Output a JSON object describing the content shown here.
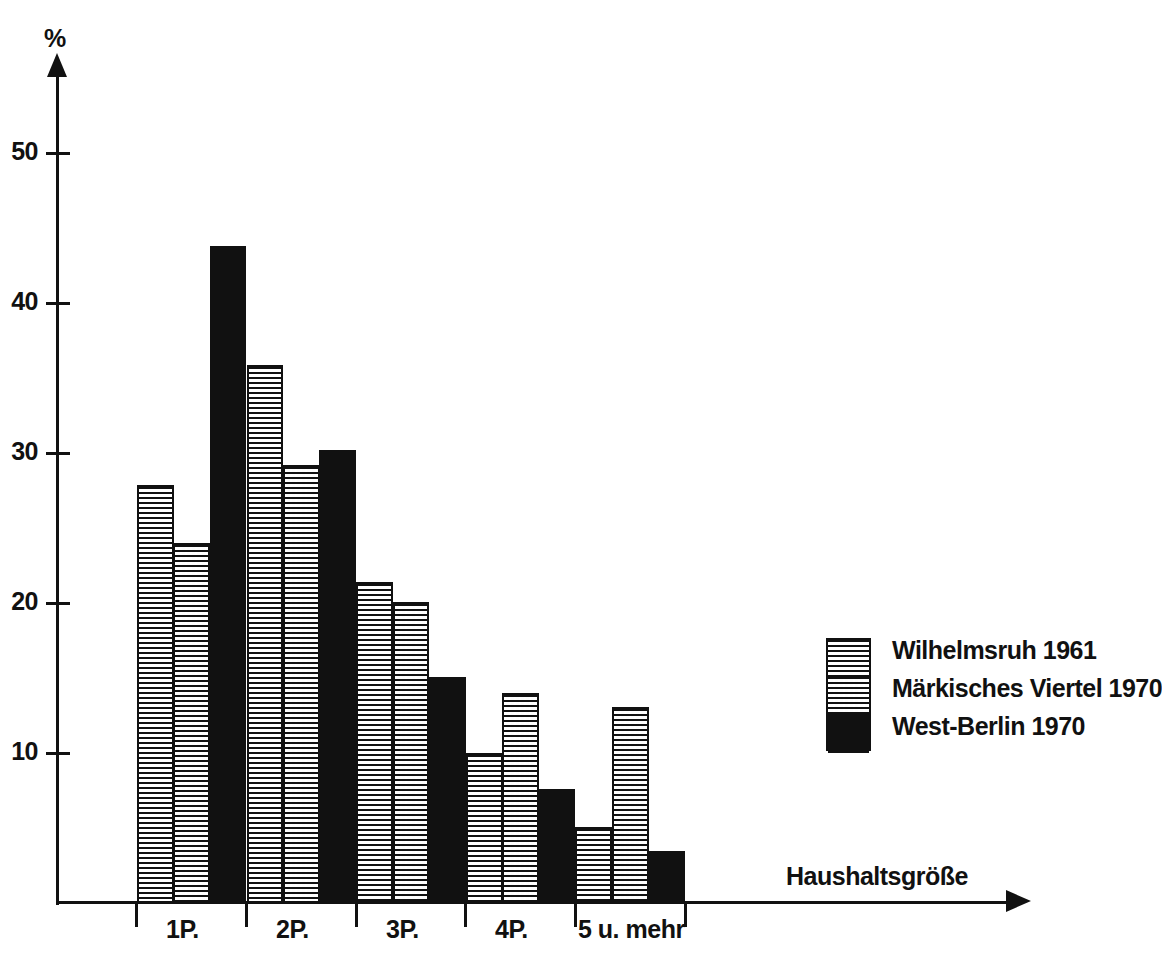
{
  "chart_data": {
    "type": "bar",
    "title": "",
    "subtitle": "",
    "xlabel": "Haushaltsgröße",
    "ylabel": "%",
    "categories": [
      "1 P.",
      "2 P.",
      "3 P.",
      "4 P.",
      "5 u. mehr"
    ],
    "category_labels": [
      "1P.",
      "2P.",
      "3P.",
      "4P.",
      "5 u. mehr"
    ],
    "series": [
      {
        "name": "Wilhelmsruh 1961",
        "pattern": "horizontal-lines",
        "color": "#111111",
        "values": [
          27.9,
          35.9,
          21.4,
          10.0,
          5.1
        ]
      },
      {
        "name": "Märkisches Viertel 1970",
        "pattern": "dot-grid",
        "color": "#111111",
        "values": [
          24.0,
          29.2,
          20.1,
          14.0,
          13.1
        ]
      },
      {
        "name": "West-Berlin 1970",
        "pattern": "solid-black",
        "color": "#111111",
        "values": [
          43.8,
          30.2,
          15.1,
          7.6,
          3.5
        ]
      }
    ],
    "ylim": [
      0,
      56
    ],
    "yticks": [
      10,
      20,
      30,
      40,
      50
    ],
    "ytick_labels": [
      "10",
      "20",
      "30",
      "40",
      "50"
    ],
    "grid": false,
    "legend_position": "right"
  },
  "axes": {
    "y_unit_label": "%",
    "x_title": "Haushaltsgröße",
    "y_ticks": [
      {
        "value": 50,
        "label": "50"
      },
      {
        "value": 40,
        "label": "40"
      },
      {
        "value": 30,
        "label": "30"
      },
      {
        "value": 20,
        "label": "20"
      },
      {
        "value": 10,
        "label": "10"
      }
    ],
    "x_ticks": [
      {
        "label": "1P."
      },
      {
        "label": "2P."
      },
      {
        "label": "3P."
      },
      {
        "label": "4P."
      },
      {
        "label": "5 u. mehr"
      }
    ]
  },
  "legend": {
    "entries": [
      {
        "label": "Wilhelmsruh 1961",
        "pattern": "horizontal-lines"
      },
      {
        "label": "Märkisches Viertel 1970",
        "pattern": "dot-grid"
      },
      {
        "label": "West-Berlin 1970",
        "pattern": "solid-black"
      }
    ]
  }
}
